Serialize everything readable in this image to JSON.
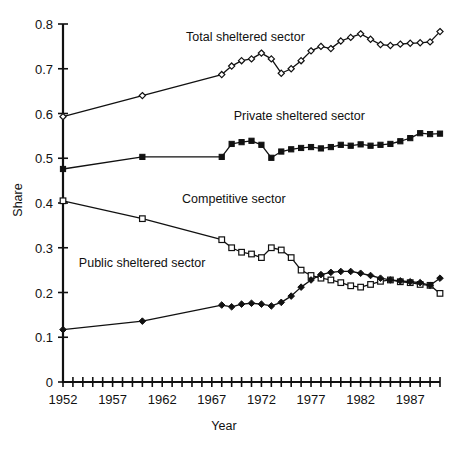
{
  "chart_data": {
    "type": "line",
    "title": "",
    "xlabel": "Year",
    "ylabel": "Share",
    "xlim": [
      1952,
      1990
    ],
    "ylim": [
      0,
      0.8
    ],
    "ytick_labels": [
      "0",
      "0.1",
      "0.2",
      "0.3",
      "0.4",
      "0.5",
      "0.6",
      "0.7",
      "0.8"
    ],
    "ytick_values": [
      0,
      0.1,
      0.2,
      0.3,
      0.4,
      0.5,
      0.6,
      0.7,
      0.8
    ],
    "xtick_labels": [
      "1952",
      "1957",
      "1962",
      "1967",
      "1972",
      "1977",
      "1982",
      "1987"
    ],
    "xtick_values": [
      1952,
      1957,
      1962,
      1967,
      1972,
      1977,
      1982,
      1987
    ],
    "xtick_minor_step": 1,
    "grid": false,
    "legend_position": "inline-annotations",
    "series": [
      {
        "name": "Total sheltered sector",
        "marker": "open-diamond",
        "label_x": 1964.4,
        "label_y": 0.763,
        "x": [
          1952,
          1960,
          1968,
          1969,
          1970,
          1971,
          1972,
          1973,
          1974,
          1975,
          1976,
          1977,
          1978,
          1979,
          1980,
          1981,
          1982,
          1983,
          1984,
          1985,
          1986,
          1987,
          1988,
          1989,
          1990
        ],
        "y": [
          0.593,
          0.64,
          0.687,
          0.706,
          0.718,
          0.722,
          0.735,
          0.722,
          0.69,
          0.7,
          0.718,
          0.74,
          0.75,
          0.745,
          0.762,
          0.77,
          0.778,
          0.766,
          0.754,
          0.752,
          0.755,
          0.757,
          0.758,
          0.76,
          0.783
        ]
      },
      {
        "name": "Private sheltered sector",
        "marker": "filled-square",
        "label_x": 1969.2,
        "label_y": 0.585,
        "x": [
          1952,
          1960,
          1968,
          1969,
          1970,
          1971,
          1972,
          1973,
          1974,
          1975,
          1976,
          1977,
          1978,
          1979,
          1980,
          1981,
          1982,
          1983,
          1984,
          1985,
          1986,
          1987,
          1988,
          1989,
          1990
        ],
        "y": [
          0.476,
          0.503,
          0.503,
          0.532,
          0.536,
          0.539,
          0.53,
          0.501,
          0.515,
          0.52,
          0.523,
          0.525,
          0.522,
          0.525,
          0.53,
          0.528,
          0.531,
          0.528,
          0.53,
          0.532,
          0.538,
          0.545,
          0.556,
          0.554,
          0.555
        ]
      },
      {
        "name": "Competitive sector",
        "marker": "open-square",
        "label_x": 1964.0,
        "label_y": 0.4,
        "x": [
          1952,
          1960,
          1968,
          1969,
          1970,
          1971,
          1972,
          1973,
          1974,
          1975,
          1976,
          1977,
          1978,
          1979,
          1980,
          1981,
          1982,
          1983,
          1984,
          1985,
          1986,
          1987,
          1988,
          1989,
          1990
        ],
        "y": [
          0.405,
          0.365,
          0.318,
          0.3,
          0.29,
          0.286,
          0.278,
          0.3,
          0.295,
          0.278,
          0.25,
          0.238,
          0.232,
          0.228,
          0.222,
          0.215,
          0.212,
          0.218,
          0.225,
          0.228,
          0.224,
          0.222,
          0.218,
          0.216,
          0.198
        ]
      },
      {
        "name": "Public sheltered sector",
        "marker": "filled-diamond",
        "label_x": 1953.6,
        "label_y": 0.258,
        "x": [
          1952,
          1960,
          1968,
          1969,
          1970,
          1971,
          1972,
          1973,
          1974,
          1975,
          1976,
          1977,
          1978,
          1979,
          1980,
          1981,
          1982,
          1983,
          1984,
          1985,
          1986,
          1987,
          1988,
          1989,
          1990
        ],
        "y": [
          0.117,
          0.136,
          0.172,
          0.168,
          0.174,
          0.176,
          0.174,
          0.17,
          0.178,
          0.192,
          0.212,
          0.228,
          0.24,
          0.245,
          0.247,
          0.247,
          0.243,
          0.238,
          0.232,
          0.228,
          0.226,
          0.224,
          0.222,
          0.216,
          0.232
        ]
      }
    ]
  }
}
